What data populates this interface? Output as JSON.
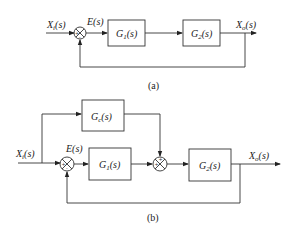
{
  "diagram_a": {
    "caption": "(a)",
    "input": "X_i(s)",
    "input_label": "Xi(s)",
    "error_label": "E(s)",
    "blocks": [
      {
        "id": "G1",
        "label": "G1(s)"
      },
      {
        "id": "G2",
        "label": "G2(s)"
      }
    ],
    "output_label": "Xo(s)",
    "summing_signs": [
      "+",
      "-"
    ]
  },
  "diagram_b": {
    "caption": "(b)",
    "input_label": "Xi(s)",
    "error_label": "E(s)",
    "blocks": [
      {
        "id": "Gc",
        "label": "Gc(s)"
      },
      {
        "id": "G1",
        "label": "G1(s)"
      },
      {
        "id": "G2",
        "label": "G2(s)"
      }
    ],
    "output_label": "Xo(s)",
    "summing_junctions": [
      {
        "id": "sum1",
        "signs": [
          "+",
          "-"
        ]
      },
      {
        "id": "sum2",
        "signs": [
          "+",
          "+"
        ]
      }
    ]
  },
  "text": {
    "a_xi_main": "X",
    "a_xi_sub": "i",
    "a_xi_tail": "(s)",
    "a_e": "E(s)",
    "a_g1_main": "G",
    "a_g1_sub": "1",
    "a_g1_tail": "(s)",
    "a_g2_main": "G",
    "a_g2_sub": "2",
    "a_g2_tail": "(s)",
    "a_xo_main": "X",
    "a_xo_sub": "o",
    "a_xo_tail": "(s)",
    "a_caption": "(a)",
    "b_gc_main": "G",
    "b_gc_sub": "c",
    "b_gc_tail": "(s)",
    "b_xi_main": "X",
    "b_xi_sub": "i",
    "b_xi_tail": "(s)",
    "b_e": "E(s)",
    "b_g1_main": "G",
    "b_g1_sub": "1",
    "b_g1_tail": "(s)",
    "b_g2_main": "G",
    "b_g2_sub": "2",
    "b_g2_tail": "(s)",
    "b_xo_main": "X",
    "b_xo_sub": "o",
    "b_xo_tail": "(s)",
    "b_caption": "(b)"
  }
}
